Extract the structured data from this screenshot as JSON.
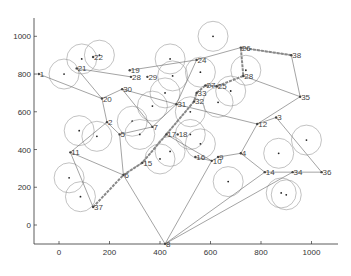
{
  "chart_data": {
    "type": "scatter",
    "title": "",
    "xlabel": "",
    "ylabel": "",
    "xlim": [
      -100,
      1100
    ],
    "ylim": [
      -100,
      1100
    ],
    "xticks": [
      0,
      200,
      400,
      600,
      800,
      1000
    ],
    "yticks": [
      0,
      200,
      400,
      600,
      800,
      1000
    ],
    "grid": false,
    "nodes": [
      {
        "id": "1",
        "x": -80,
        "y": 800
      },
      {
        "id": "2",
        "x": 190,
        "y": 545
      },
      {
        "id": "3",
        "x": 860,
        "y": 570
      },
      {
        "id": "4",
        "x": 720,
        "y": 380
      },
      {
        "id": "5",
        "x": 240,
        "y": 480
      },
      {
        "id": "6",
        "x": 255,
        "y": 265
      },
      {
        "id": "7",
        "x": 370,
        "y": 520
      },
      {
        "id": "8",
        "x": 420,
        "y": -100
      },
      {
        "id": "9",
        "x": 630,
        "y": 360
      },
      {
        "id": "10",
        "x": 605,
        "y": 340
      },
      {
        "id": "11",
        "x": 45,
        "y": 385
      },
      {
        "id": "12",
        "x": 785,
        "y": 535
      },
      {
        "id": "14",
        "x": 815,
        "y": 280
      },
      {
        "id": "15",
        "x": 330,
        "y": 330
      },
      {
        "id": "16",
        "x": 540,
        "y": 360
      },
      {
        "id": "17",
        "x": 425,
        "y": 480
      },
      {
        "id": "18",
        "x": 470,
        "y": 480
      },
      {
        "id": "19",
        "x": 280,
        "y": 820
      },
      {
        "id": "20",
        "x": 170,
        "y": 670
      },
      {
        "id": "21",
        "x": 70,
        "y": 830
      },
      {
        "id": "22",
        "x": 135,
        "y": 890
      },
      {
        "id": "24",
        "x": 545,
        "y": 875
      },
      {
        "id": "25",
        "x": 625,
        "y": 735
      },
      {
        "id": "26",
        "x": 720,
        "y": 940
      },
      {
        "id": "27",
        "x": 580,
        "y": 740
      },
      {
        "id": "28",
        "x": 285,
        "y": 785
      },
      {
        "id": "29",
        "x": 350,
        "y": 785
      },
      {
        "id": "30",
        "x": 250,
        "y": 720
      },
      {
        "id": "31",
        "x": 465,
        "y": 640
      },
      {
        "id": "32",
        "x": 535,
        "y": 655
      },
      {
        "id": "33",
        "x": 545,
        "y": 700
      },
      {
        "id": "34",
        "x": 925,
        "y": 280
      },
      {
        "id": "35",
        "x": 955,
        "y": 680
      },
      {
        "id": "36",
        "x": 1040,
        "y": 280
      },
      {
        "id": "37",
        "x": 135,
        "y": 95
      },
      {
        "id": "38",
        "x": 920,
        "y": 900
      },
      {
        "id": "28b",
        "label": "28",
        "x": 730,
        "y": 790
      }
    ],
    "sensors": [
      {
        "x": 20,
        "y": 800
      },
      {
        "x": 90,
        "y": 880
      },
      {
        "x": 160,
        "y": 900
      },
      {
        "x": 440,
        "y": 880
      },
      {
        "x": 610,
        "y": 1000
      },
      {
        "x": 450,
        "y": 790
      },
      {
        "x": 560,
        "y": 810
      },
      {
        "x": 740,
        "y": 820
      },
      {
        "x": 680,
        "y": 710
      },
      {
        "x": 630,
        "y": 650
      },
      {
        "x": 420,
        "y": 700
      },
      {
        "x": 520,
        "y": 600
      },
      {
        "x": 370,
        "y": 630
      },
      {
        "x": 80,
        "y": 500
      },
      {
        "x": 150,
        "y": 470
      },
      {
        "x": 290,
        "y": 550
      },
      {
        "x": 320,
        "y": 480
      },
      {
        "x": 520,
        "y": 480
      },
      {
        "x": 560,
        "y": 430
      },
      {
        "x": 400,
        "y": 350
      },
      {
        "x": 440,
        "y": 390
      },
      {
        "x": 670,
        "y": 230
      },
      {
        "x": 870,
        "y": 380
      },
      {
        "x": 980,
        "y": 450
      },
      {
        "x": 40,
        "y": 250
      },
      {
        "x": 85,
        "y": 150
      },
      {
        "x": 880,
        "y": 170
      },
      {
        "x": 900,
        "y": 160
      }
    ],
    "edges": [
      [
        "1",
        "20"
      ],
      [
        "21",
        "20"
      ],
      [
        "21",
        "28"
      ],
      [
        "20",
        "30"
      ],
      [
        "20",
        "2"
      ],
      [
        "30",
        "31"
      ],
      [
        "30",
        "7"
      ],
      [
        "2",
        "11"
      ],
      [
        "2",
        "5"
      ],
      [
        "5",
        "7"
      ],
      [
        "5",
        "6"
      ],
      [
        "11",
        "6"
      ],
      [
        "11",
        "37"
      ],
      [
        "6",
        "8"
      ],
      [
        "6",
        "15"
      ],
      [
        "15",
        "32"
      ],
      [
        "7",
        "31"
      ],
      [
        "17",
        "10"
      ],
      [
        "16",
        "10"
      ],
      [
        "10",
        "9"
      ],
      [
        "9",
        "4"
      ],
      [
        "4",
        "12"
      ],
      [
        "4",
        "14"
      ],
      [
        "12",
        "3"
      ],
      [
        "12",
        "31"
      ],
      [
        "3",
        "36"
      ],
      [
        "14",
        "34"
      ],
      [
        "34",
        "36"
      ],
      [
        "8",
        "10"
      ],
      [
        "14",
        "8"
      ],
      [
        "34",
        "8"
      ],
      [
        "19",
        "24"
      ],
      [
        "24",
        "26"
      ],
      [
        "24",
        "31"
      ],
      [
        "28b",
        "35"
      ],
      [
        "35",
        "12"
      ],
      [
        "26",
        "38"
      ],
      [
        "38",
        "35"
      ]
    ],
    "route": [
      "37",
      "6",
      "15",
      "17",
      "32",
      "33",
      "27",
      "25",
      "28b",
      "26",
      "38"
    ]
  }
}
